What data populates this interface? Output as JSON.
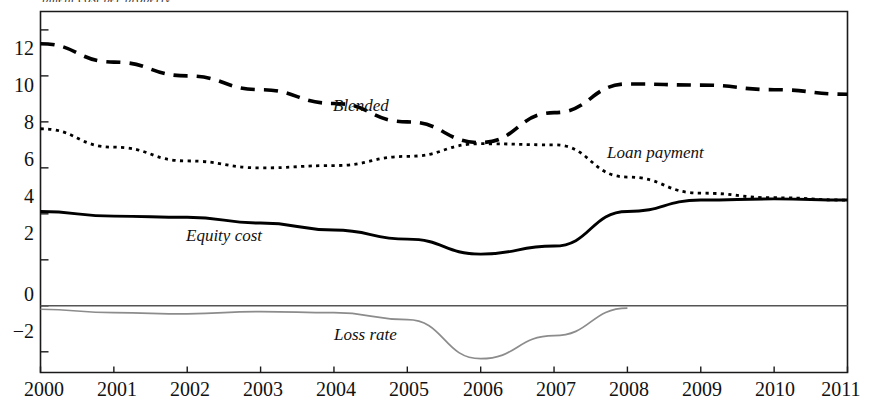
{
  "figure": {
    "clipped_top_caption": "pment cost per property,",
    "x_axis_title": "",
    "y_axis_title": ""
  },
  "axes": {
    "y_ticks": [
      12,
      10,
      8,
      6,
      4,
      2,
      0,
      -2
    ],
    "y_tick_labels": [
      "12",
      "10",
      "8",
      "6",
      "4",
      "2",
      "0",
      "−2"
    ],
    "x_ticks": [
      2000,
      2001,
      2002,
      2003,
      2004,
      2005,
      2006,
      2007,
      2008,
      2009,
      2010,
      2011
    ],
    "x_tick_labels": [
      "2000",
      "2001",
      "2002",
      "2003",
      "2004",
      "2005",
      "2006",
      "2007",
      "2008",
      "2009",
      "2010",
      "2011"
    ]
  },
  "series_labels": {
    "blended": "Blended",
    "loan_payment": "Loan payment",
    "equity_cost": "Equity cost",
    "loss_rate": "Loss rate"
  },
  "colors": {
    "blended": "#000000",
    "loan_payment": "#000000",
    "equity_cost": "#000000",
    "loss_rate": "#8c8c8c",
    "axis": "#1a1a1a",
    "zero_line": "#555555",
    "background": "#ffffff"
  },
  "chart_data": {
    "type": "line",
    "title": "",
    "subtitle": "",
    "xlabel": "",
    "ylabel": "",
    "xlim": [
      2000,
      2011
    ],
    "ylim": [
      -2.9,
      12.8
    ],
    "grid": false,
    "legend": "inline-annotations",
    "x": [
      2000,
      2001,
      2002,
      2003,
      2004,
      2005,
      2006,
      2007,
      2008,
      2009,
      2010,
      2011
    ],
    "series": [
      {
        "name": "Blended",
        "style": "long-dashed",
        "color": "#000000",
        "values": [
          11.4,
          10.6,
          10.0,
          9.4,
          8.8,
          8.0,
          7.1,
          8.4,
          9.65,
          9.6,
          9.4,
          9.2
        ]
      },
      {
        "name": "Loan payment",
        "style": "dotted",
        "color": "#000000",
        "values": [
          7.7,
          6.9,
          6.3,
          6.0,
          6.1,
          6.5,
          7.05,
          7.0,
          5.6,
          4.9,
          4.7,
          4.6
        ]
      },
      {
        "name": "Equity cost",
        "style": "solid",
        "color": "#000000",
        "values": [
          4.1,
          3.9,
          3.85,
          3.6,
          3.3,
          2.9,
          2.25,
          2.6,
          4.1,
          4.6,
          4.65,
          4.6
        ]
      },
      {
        "name": "Loss rate",
        "style": "solid-thin",
        "color": "#8c8c8c",
        "values": [
          -0.15,
          -0.3,
          -0.35,
          -0.25,
          -0.3,
          -0.6,
          -2.3,
          -1.3,
          -0.1,
          null,
          null,
          null
        ]
      }
    ]
  }
}
